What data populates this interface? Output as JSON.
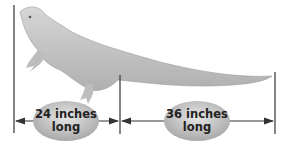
{
  "figure": {
    "segments": [
      {
        "label_line1": "24 inches",
        "label_line2": "long",
        "span": "head-to-hips"
      },
      {
        "label_line1": "36 inches",
        "label_line2": "long",
        "span": "tail"
      }
    ],
    "colors": {
      "line": "#333333",
      "ellipse": "#bdbdbd",
      "body": "#c9c9c9",
      "text": "#222222"
    }
  }
}
